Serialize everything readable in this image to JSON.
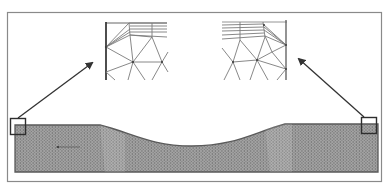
{
  "diagram": {
    "type": "finite-element-mesh-with-zoom-insets",
    "colors": {
      "background": "#ffffff",
      "frame": "#8a8a8a",
      "mesh_fill": "#9a9a9a",
      "mesh_dots": "#6e6e6e",
      "mesh_outline": "#5a5a5a",
      "arrow": "#333333",
      "highlight_box": "#2e2e2e",
      "inset_lines": "#7a7a7a",
      "inset_boundary": "#3a3a3a"
    },
    "frame": {
      "x": 7,
      "y": 12,
      "width": 375,
      "height": 170
    },
    "mesh_body": {
      "left_x": 15,
      "right_x": 378,
      "top_flat_y": 124,
      "bottom_y": 172,
      "dip_start_x": 100,
      "dip_end_x": 285,
      "dip_min_y": 146
    },
    "highlight_boxes": [
      {
        "name": "left-corner-box",
        "x": 10,
        "y": 118,
        "size": 15
      },
      {
        "name": "right-corner-box",
        "x": 361,
        "y": 117,
        "size": 15
      }
    ],
    "arrows": [
      {
        "name": "left-arrow",
        "from": [
          18,
          118
        ],
        "to": [
          93,
          62
        ]
      },
      {
        "name": "right-arrow",
        "from": [
          364,
          117
        ],
        "to": [
          298,
          58
        ]
      }
    ],
    "insets": [
      {
        "name": "left-inset",
        "x": 105,
        "y": 22,
        "width": 63,
        "height": 58,
        "boundary_side": "left"
      },
      {
        "name": "right-inset",
        "x": 222,
        "y": 20,
        "width": 66,
        "height": 60,
        "boundary_side": "right"
      }
    ]
  }
}
